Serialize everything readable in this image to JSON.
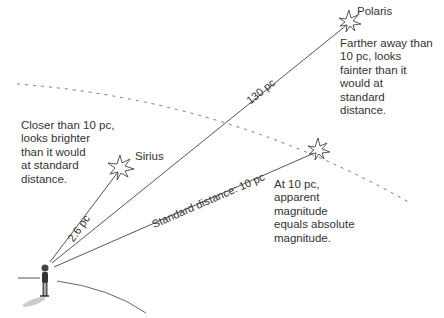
{
  "diagram": {
    "stars": [
      {
        "name": "Polaris",
        "distance_label": "130 pc",
        "note": "Farther away than\n10 pc, looks\nfainter than it\nwould at\nstandard\ndistance."
      },
      {
        "name": "Sirius",
        "distance_label": "2.6 pc",
        "note": "Closer than 10 pc,\nlooks brighter\nthan it would\nat standard\ndistance."
      },
      {
        "name": "",
        "distance_label": "Standard distance: 10 pc",
        "note": "At 10 pc,\napparent\nmagnitude\nequals absolute\nmagnitude."
      }
    ],
    "colors": {
      "line": "#555555",
      "dashed_arc": "#777777",
      "text": "#333333"
    }
  }
}
